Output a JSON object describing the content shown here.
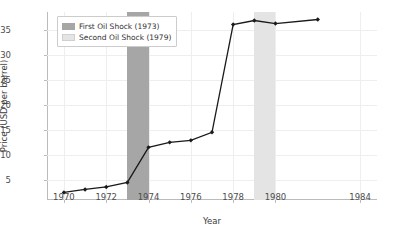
{
  "chart_data": {
    "type": "line",
    "title": "",
    "xlabel": "Year",
    "ylabel": "Price (USD per barrel)",
    "xlim": [
      1969.2,
      1984.8
    ],
    "ylim": [
      1.0,
      38.5
    ],
    "grid": true,
    "legend_position": "upper left",
    "x": [
      1970,
      1971,
      1972,
      1973,
      1974,
      1975,
      1976,
      1977,
      1978,
      1979,
      1980,
      1982
    ],
    "values": [
      2.5,
      3.1,
      3.6,
      4.5,
      11.5,
      12.5,
      12.9,
      14.5,
      36.0,
      36.8,
      36.2,
      37.0
    ],
    "series": [
      {
        "name": "Crude Oil Price",
        "values": [
          2.5,
          3.1,
          3.6,
          4.5,
          11.5,
          12.5,
          12.9,
          14.5,
          36.0,
          36.8,
          36.2,
          37.0
        ],
        "color": "#1a1a1a",
        "marker": "diamond"
      }
    ],
    "xticks": [
      1970,
      1972,
      1974,
      1976,
      1978,
      1980,
      1984
    ],
    "xtick_labels": [
      "1970",
      "1972",
      "1974",
      "1976",
      "1978",
      "1980",
      "1984"
    ],
    "yticks": [
      5,
      10,
      15,
      20,
      25,
      30,
      35
    ],
    "ytick_labels": [
      "5",
      "10",
      "15",
      "20",
      "25",
      "30",
      "35"
    ],
    "annotations": [
      {
        "label": "First Oil Shock (1973)",
        "type": "vspan",
        "start": 1973,
        "end": 1974,
        "color": "#a6a6a6"
      },
      {
        "label": "Second Oil Shock (1979)",
        "type": "vspan",
        "start": 1979,
        "end": 1980,
        "color": "#e4e4e4"
      }
    ],
    "legend": [
      {
        "label": "First Oil Shock (1973)",
        "color": "#a6a6a6"
      },
      {
        "label": "Second Oil Shock (1979)",
        "color": "#e4e4e4"
      }
    ]
  },
  "colors": {
    "line": "#1a1a1a",
    "grid": "#eeeeee",
    "axis": "#bbbbbb",
    "first_shock": "#a6a6a6",
    "second_shock": "#e4e4e4",
    "scrollbar": "#9a9a9a"
  }
}
